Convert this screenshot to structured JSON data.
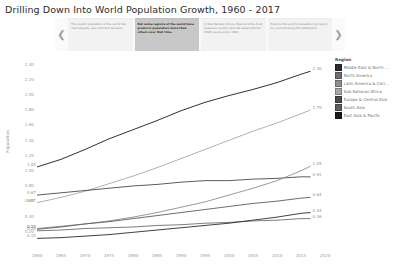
{
  "title": "Drilling Down Into World Population Growth, 1960 - 2017",
  "story_nav": {
    "prev_icon": "chevron-left-icon",
    "next_icon": "chevron-right-icon",
    "points": [
      {
        "text": "The overall population of the world has risen steadily over almost 6 decades.",
        "active": false
      },
      {
        "text": "But some regions of the world have grown in population more than others over that time.",
        "active": true
      },
      {
        "text": "In Sub Saharan Africa, Nigeria is the most populous country and has added almost 150M people since 1960.",
        "active": false
      },
      {
        "text": "Explore the world's population by region for yourself using this dashboard.",
        "active": false
      }
    ]
  },
  "legend": {
    "title": "Region",
    "items": [
      {
        "label": "Middle East & North ...",
        "color": "#2b2b2b"
      },
      {
        "label": "North America",
        "color": "#6e6e6e"
      },
      {
        "label": "Latin America & Cari...",
        "color": "#8f8f8f"
      },
      {
        "label": "Sub-Saharan Africa",
        "color": "#a8a8a8"
      },
      {
        "label": "Europe & Central Asia",
        "color": "#4a4a4a"
      },
      {
        "label": "South Asia",
        "color": "#5d5d5d"
      },
      {
        "label": "East Asia & Pacific",
        "color": "#1a1a1a"
      }
    ]
  },
  "chart_data": {
    "type": "line",
    "title": "Drilling Down Into World Population Growth, 1960 - 2017",
    "xlabel": "",
    "ylabel": "Population",
    "xlim": [
      1960,
      2020
    ],
    "ylim": [
      0,
      2.5
    ],
    "grid": false,
    "legend_position": "right",
    "x_ticks": [
      1960,
      1965,
      1970,
      1975,
      1980,
      1985,
      1990,
      1995,
      2000,
      2005,
      2010,
      2015,
      2020
    ],
    "y_ticks": [
      "0.20",
      "0.40",
      "0.60",
      "0.80",
      "1.00",
      "1.20",
      "1.40",
      "1.60",
      "1.80",
      "2.00",
      "2.20",
      "2.40"
    ],
    "x": [
      1960,
      1965,
      1970,
      1975,
      1980,
      1985,
      1990,
      1995,
      2000,
      2005,
      2010,
      2015,
      2017
    ],
    "series": [
      {
        "name": "East Asia & Pacific",
        "color": "#1a1a1a",
        "start_label": "1.04",
        "end_label": "2.30",
        "values": [
          1.04,
          1.14,
          1.27,
          1.41,
          1.53,
          1.65,
          1.78,
          1.89,
          1.98,
          2.06,
          2.15,
          2.26,
          2.3
        ]
      },
      {
        "name": "South Asia",
        "color": "#a8a8a8",
        "start_label": "0.57",
        "end_label": "1.79",
        "values": [
          0.57,
          0.64,
          0.72,
          0.82,
          0.92,
          1.03,
          1.15,
          1.27,
          1.39,
          1.51,
          1.62,
          1.74,
          1.79
        ]
      },
      {
        "name": "Europe & Central Asia",
        "color": "#4a4a4a",
        "start_label": "0.67",
        "end_label": "0.91",
        "values": [
          0.67,
          0.7,
          0.73,
          0.76,
          0.79,
          0.81,
          0.84,
          0.86,
          0.86,
          0.88,
          0.89,
          0.91,
          0.91
        ]
      },
      {
        "name": "Sub-Saharan Africa",
        "color": "#8f8f8f",
        "start_label": "0.23",
        "end_label": "1.05",
        "values": [
          0.23,
          0.26,
          0.29,
          0.33,
          0.38,
          0.44,
          0.51,
          0.58,
          0.67,
          0.76,
          0.86,
          0.99,
          1.05
        ]
      },
      {
        "name": "Latin America & Caribbean",
        "color": "#5d5d5d",
        "start_label": "0.22",
        "end_label": "0.64",
        "values": [
          0.22,
          0.25,
          0.29,
          0.32,
          0.36,
          0.4,
          0.44,
          0.48,
          0.52,
          0.56,
          0.59,
          0.63,
          0.64
        ]
      },
      {
        "name": "North America",
        "color": "#6e6e6e",
        "start_label": "0.20",
        "end_label": "0.36",
        "values": [
          0.2,
          0.21,
          0.23,
          0.24,
          0.25,
          0.27,
          0.28,
          0.3,
          0.31,
          0.33,
          0.34,
          0.36,
          0.36
        ]
      },
      {
        "name": "Middle East & North Africa",
        "color": "#2b2b2b",
        "start_label": "0.10",
        "end_label": "0.44",
        "values": [
          0.1,
          0.11,
          0.13,
          0.15,
          0.18,
          0.21,
          0.24,
          0.27,
          0.3,
          0.34,
          0.38,
          0.43,
          0.44
        ]
      }
    ]
  }
}
